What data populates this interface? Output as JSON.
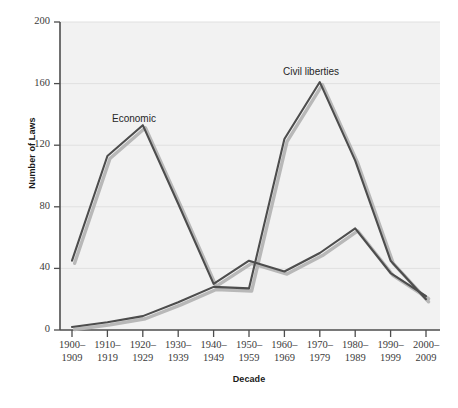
{
  "chart_data": {
    "type": "line",
    "title": "",
    "xlabel": "Decade",
    "ylabel": "Number of Laws",
    "ylim": [
      0,
      200
    ],
    "yticks": [
      0,
      40,
      80,
      120,
      160,
      200
    ],
    "grid": true,
    "legend_position": "inline-annotation",
    "categories": [
      "1900–1909",
      "1910–1919",
      "1920–1929",
      "1930–1939",
      "1940–1949",
      "1950–1959",
      "1960–1969",
      "1970–1979",
      "1980–1989",
      "1990–1999",
      "2000–2009"
    ],
    "category_lines": [
      [
        "1900–",
        "1909"
      ],
      [
        "1910–",
        "1919"
      ],
      [
        "1920–",
        "1929"
      ],
      [
        "1930–",
        "1939"
      ],
      [
        "1940–",
        "1949"
      ],
      [
        "1950–",
        "1959"
      ],
      [
        "1960–",
        "1969"
      ],
      [
        "1970–",
        "1979"
      ],
      [
        "1980–",
        "1989"
      ],
      [
        "1990–",
        "1999"
      ],
      [
        "2000–",
        "2009"
      ]
    ],
    "series": [
      {
        "name": "Economic",
        "label": "Economic",
        "color": "#4d4d4d",
        "values": [
          45,
          113,
          133,
          82,
          30,
          45,
          38,
          50,
          66,
          37,
          22
        ]
      },
      {
        "name": "Civil liberties",
        "label": "Civil liberties",
        "color": "#4d4d4d",
        "values": [
          2,
          5,
          9,
          18,
          28,
          27,
          124,
          161,
          110,
          45,
          20
        ]
      }
    ]
  },
  "annotations": {
    "economic_label": "Economic",
    "civil_liberties_label": "Civil liberties"
  },
  "axis": {
    "y_title": "Number of Laws",
    "x_title": "Decade",
    "y_tick_labels": [
      "0",
      "40",
      "80",
      "120",
      "160",
      "200"
    ]
  },
  "colors": {
    "line": "#4d4d4d",
    "line_shadow": "#b4b4b4",
    "plot_background": "#f2f2f2",
    "gridline": "#e0e0e0",
    "axis": "#4d4d4d",
    "text": "#3b3b3b"
  }
}
